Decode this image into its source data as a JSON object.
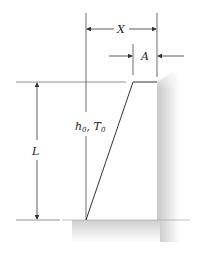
{
  "diagram": {
    "labels": {
      "x": "X",
      "a": "A",
      "l": "L",
      "h_main": "h",
      "h_sub": "0",
      "sep": ", ",
      "t_main": "T",
      "t_sub": "0"
    },
    "colors": {
      "line": "#333333",
      "wall": "#cfcfcf",
      "ground": "#d6d6d6",
      "background": "#ffffff"
    }
  }
}
